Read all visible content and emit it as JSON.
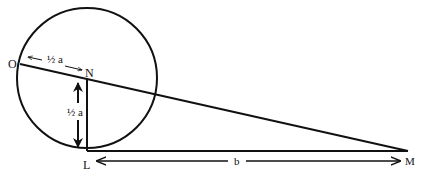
{
  "diagram": {
    "points": {
      "O": "O",
      "N": "N",
      "L": "L",
      "M": "M"
    },
    "labels": {
      "on_length": "½ a",
      "nl_length": "½ a",
      "lm_length": "b"
    },
    "colors": {
      "stroke": "#111111",
      "background": "#ffffff"
    }
  }
}
